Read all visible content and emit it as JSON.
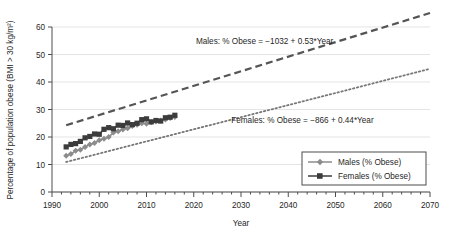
{
  "chart_data": {
    "type": "scatter",
    "title": "",
    "xlabel": "Year",
    "ylabel": "Percentage of population obese (BMI > 30 kg/m²)",
    "xlim": [
      1990,
      2070
    ],
    "ylim": [
      0,
      60
    ],
    "xticks": [
      1990,
      2000,
      2010,
      2020,
      2030,
      2040,
      2050,
      2060,
      2070
    ],
    "xtick_labels": [
      "1990",
      "2000",
      "2010",
      "2020",
      "2030",
      "2040",
      "2050",
      "2060",
      "2070"
    ],
    "xminor_step": 2,
    "yticks": [
      0,
      10,
      20,
      30,
      40,
      50,
      60
    ],
    "ytick_labels": [
      "0",
      "10",
      "20",
      "30",
      "40",
      "50",
      "60"
    ],
    "grid": "horizontal",
    "legend_position": "lower-right",
    "annotations": [
      {
        "name": "males-equation",
        "text": "Males: % Obese = −1032 + 0.53*Year",
        "x": 2035,
        "y": 54
      },
      {
        "name": "females-equation",
        "text": "Females: % Obese = −866  + 0.44*Year",
        "x": 2043,
        "y": 25
      }
    ],
    "series": [
      {
        "name": "Males (% Obese)",
        "legend_label": "Males (% Obese)",
        "marker": "diamond",
        "color": "#8c8c8c",
        "linestyle": "solid",
        "x": [
          1993,
          1994,
          1995,
          1996,
          1997,
          1998,
          1999,
          2000,
          2001,
          2002,
          2003,
          2004,
          2005,
          2006,
          2007,
          2008,
          2009,
          2010,
          2011,
          2012,
          2013,
          2014,
          2015,
          2016
        ],
        "values": [
          13.2,
          13.8,
          15.0,
          15.4,
          16.4,
          17.3,
          17.8,
          18.8,
          19.4,
          20.0,
          21.6,
          22.1,
          22.7,
          23.2,
          24.0,
          24.5,
          25.0,
          24.8,
          25.4,
          25.6,
          26.0,
          26.4,
          26.9,
          27.3
        ]
      },
      {
        "name": "Females (% Obese)",
        "legend_label": "Females (% Obese)",
        "marker": "square",
        "color": "#3c3c3c",
        "linestyle": "solid",
        "x": [
          1993,
          1994,
          1995,
          1996,
          1997,
          1998,
          1999,
          2000,
          2001,
          2002,
          2003,
          2004,
          2005,
          2006,
          2007,
          2008,
          2009,
          2010,
          2011,
          2012,
          2013,
          2014,
          2015,
          2016
        ],
        "values": [
          16.4,
          17.3,
          17.6,
          18.4,
          19.7,
          20.2,
          21.1,
          21.0,
          22.8,
          23.4,
          23.0,
          24.3,
          24.2,
          25.1,
          24.5,
          25.0,
          26.3,
          26.6,
          25.5,
          26.0,
          25.8,
          27.0,
          27.2,
          27.9
        ]
      }
    ],
    "trendlines": [
      {
        "name": "males-trend",
        "label": "Males trend",
        "intercept": -1032,
        "slope": 0.53,
        "linestyle": "dashed",
        "color": "#555555",
        "x_start": 1993,
        "x_end": 2070
      },
      {
        "name": "females-trend",
        "label": "Females trend",
        "intercept": -866,
        "slope": 0.44,
        "linestyle": "dotted",
        "color": "#777777",
        "x_start": 1993,
        "x_end": 2070
      }
    ]
  },
  "legend": {
    "items": [
      {
        "label": "Males (% Obese)",
        "marker": "diamond",
        "color": "#8c8c8c"
      },
      {
        "label": "Females (% Obese)",
        "marker": "square",
        "color": "#3c3c3c"
      }
    ]
  },
  "axes": {
    "x_title": "Year",
    "y_title": "Percentage of population obese (BMI > 30 kg/m²)"
  },
  "colors": {
    "background": "#ffffff",
    "grid": "#d9d9d9",
    "axis": "#4d4d4d",
    "text": "#1f1f1f",
    "males": "#8c8c8c",
    "females": "#3c3c3c"
  }
}
